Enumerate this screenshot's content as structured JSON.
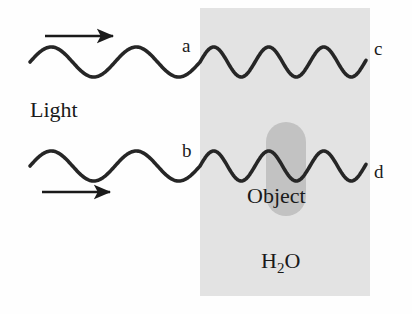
{
  "figure": {
    "background_color": "#fefefe"
  },
  "medium": {
    "name": "water-region",
    "label": "H",
    "label_sub": "2",
    "label_tail": "O",
    "fill_color": "#e3e3e3",
    "x": 200,
    "y": 8,
    "width": 170,
    "height": 288
  },
  "object": {
    "label": "Object",
    "fill_color": "#c2c2c2",
    "x": 266,
    "y": 122,
    "width": 40,
    "height": 94,
    "corner_radius": 20,
    "label_x": 247,
    "label_y": 203
  },
  "waves": [
    {
      "name": "upper-wave",
      "stroke_color": "#262626",
      "stroke_width": 3.6,
      "baseline_y": 62,
      "amplitude": 15,
      "x_start": 30,
      "x_boundary": 200,
      "x_end": 366,
      "wavelength_outside": 85,
      "wavelength_inside": 55,
      "entry_label": "a",
      "entry_label_x": 182,
      "entry_label_y": 52,
      "exit_label": "c",
      "exit_label_x": 374,
      "exit_label_y": 55
    },
    {
      "name": "lower-wave",
      "stroke_color": "#262626",
      "stroke_width": 3.6,
      "baseline_y": 166,
      "amplitude": 15,
      "x_start": 30,
      "x_boundary": 200,
      "x_end": 366,
      "wavelength_outside": 85,
      "wavelength_inside": 55,
      "entry_label": "b",
      "entry_label_x": 182,
      "entry_label_y": 157,
      "exit_label": "d",
      "exit_label_x": 374,
      "exit_label_y": 178
    }
  ],
  "arrows": [
    {
      "name": "upper-direction-arrow",
      "x1": 45,
      "x2": 113,
      "y": 36,
      "color": "#1a1a1a",
      "stroke_width": 2.6
    },
    {
      "name": "lower-direction-arrow",
      "x1": 42,
      "x2": 110,
      "y": 192,
      "color": "#1a1a1a",
      "stroke_width": 2.6
    }
  ],
  "annotations": {
    "source_label": "Light",
    "source_label_x": 30,
    "source_label_y": 117
  }
}
